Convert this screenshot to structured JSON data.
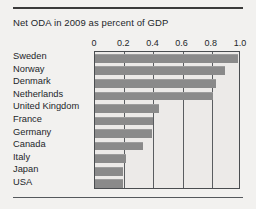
{
  "figure": {
    "title": "Net ODA in 2009 as percent of GDP",
    "rule_top": "horizontal-rule",
    "rule_bottom": "horizontal-rule"
  },
  "colors": {
    "bar": "#8a8a8a",
    "frame": "#4a4d50",
    "gridline": "#5a5d60",
    "background": "#f2f1ef",
    "plot_background": "#eceae8",
    "text": "#23262a"
  },
  "chart_data": {
    "type": "bar",
    "orientation": "horizontal",
    "title": "Net ODA in 2009 as percent of GDP",
    "xlabel": "",
    "ylabel": "",
    "xlim": [
      0,
      1.0
    ],
    "xticks": [
      0,
      0.2,
      0.4,
      0.6,
      0.8,
      1.0
    ],
    "xtick_labels": [
      "0",
      "0.2",
      "0.4",
      "0.6",
      "0.8",
      "1.0"
    ],
    "grid": true,
    "grid_axis": "x",
    "legend": false,
    "categories": [
      "Sweden",
      "Norway",
      "Denmark",
      "Netherlands",
      "United Kingdom",
      "France",
      "Germany",
      "Canada",
      "Italy",
      "Japan",
      "USA"
    ],
    "values": [
      0.98,
      0.89,
      0.83,
      0.81,
      0.44,
      0.4,
      0.39,
      0.33,
      0.21,
      0.19,
      0.19
    ]
  }
}
